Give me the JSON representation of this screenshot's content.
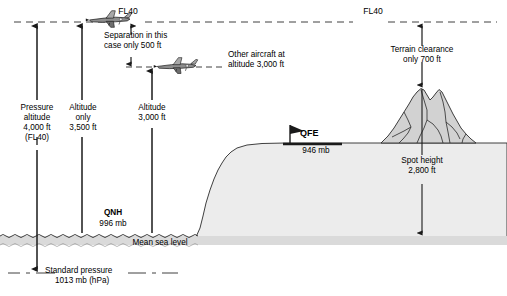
{
  "diagram": {
    "colors": {
      "line": "#1a1a1a",
      "terrain_fill": "#e8e8e8",
      "mountain_fill": "#d4d4d4",
      "sea_band": "#d9d9d9",
      "background": "#ffffff"
    },
    "flight_level_line": {
      "upper_label_left": "FL40",
      "upper_label_right": "FL40"
    },
    "columns": [
      {
        "name": "pressure-altitude",
        "lines": [
          "Pressure",
          "altitude",
          "4,000 ft",
          "(FL40)"
        ]
      },
      {
        "name": "altitude-only",
        "lines": [
          "Altitude",
          "only",
          "3,500 ft"
        ]
      },
      {
        "name": "altitude-3000",
        "lines": [
          "Altitude",
          "3,000 ft"
        ]
      }
    ],
    "annotations": {
      "separation": [
        "Separation in this",
        "case only 500 ft"
      ],
      "other_aircraft": [
        "Other aircraft at",
        "altitude 3,000 ft"
      ],
      "terrain_clearance": [
        "Terrain clearance",
        "only 700 ft"
      ],
      "spot_height": [
        "Spot height",
        "2,800 ft"
      ]
    },
    "pressure_settings": {
      "qnh_label": "QNH",
      "qnh_value": "996 mb",
      "qfe_label": "QFE",
      "qfe_value": "946 mb",
      "standard_label": "Standard pressure",
      "standard_value": "1013 mb (hPa)"
    },
    "datums": {
      "mean_sea_level": "Mean sea level"
    },
    "aircraft": [
      {
        "name": "aircraft-at-fl40",
        "altitude_label": "FL40"
      },
      {
        "name": "aircraft-at-3000ft",
        "altitude_label": "3,000 ft"
      }
    ]
  }
}
